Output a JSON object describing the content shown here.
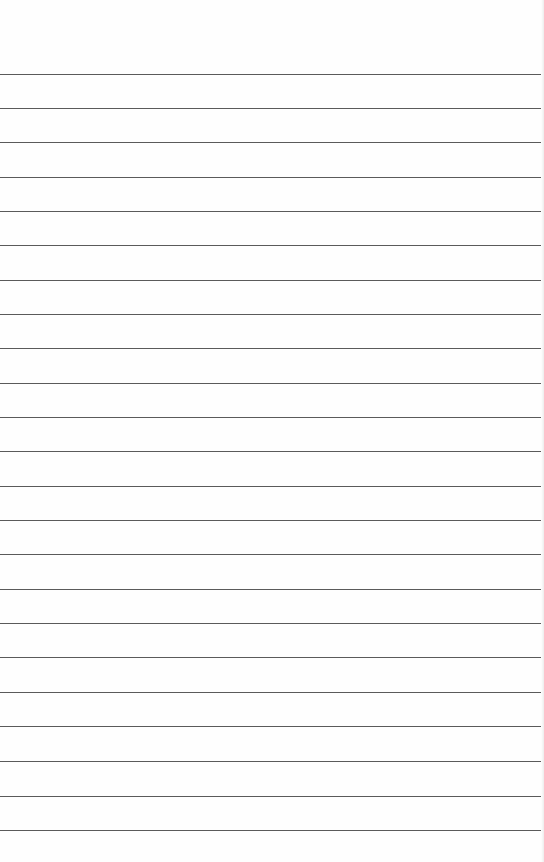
{
  "page": {
    "type": "lined-paper",
    "background_color": "#fefefe",
    "rule_color": "#5a5a5a",
    "rule_count": 23,
    "rules_y": [
      74,
      108,
      142,
      177,
      211,
      245,
      280,
      314,
      348,
      383,
      417,
      451,
      486,
      520,
      554,
      589,
      623,
      657,
      692,
      726,
      761,
      796,
      830
    ]
  }
}
